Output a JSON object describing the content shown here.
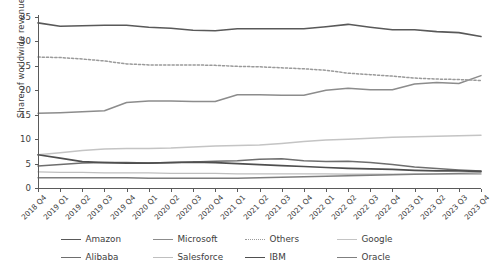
{
  "chart_data": {
    "type": "line",
    "title": "",
    "subtitle": "",
    "xlabel": "",
    "ylabel": "Share of worldwide revenues (%)",
    "ylim": [
      0,
      35
    ],
    "yticks": [
      0,
      5,
      10,
      15,
      20,
      25,
      30,
      35
    ],
    "ytick_labels": [
      "0",
      "5",
      "10",
      "15",
      "20",
      "25",
      "30",
      "35"
    ],
    "grid": false,
    "legend_position": "bottom",
    "categories": [
      "2018 Q4",
      "2019 Q1",
      "2019 Q2",
      "2019 Q3",
      "2019 Q4",
      "2020 Q1",
      "2020 Q2",
      "2020 Q3",
      "2020 Q4",
      "2021 Q1",
      "2021 Q2",
      "2021 Q3",
      "2021 Q4",
      "2022 Q1",
      "2022 Q2",
      "2022 Q3",
      "2022 Q4",
      "2023 Q1",
      "2023 Q2",
      "2023 Q3",
      "2023 Q4"
    ],
    "series": [
      {
        "name": "Amazon",
        "color": "#595959",
        "width": 1.6,
        "dash": "none",
        "values": [
          33.8,
          33.1,
          33.2,
          33.3,
          33.3,
          32.9,
          32.7,
          32.3,
          32.2,
          32.6,
          32.6,
          32.6,
          32.6,
          33.0,
          33.5,
          32.9,
          32.4,
          32.4,
          32.0,
          31.8,
          31.0
        ]
      },
      {
        "name": "Microsoft",
        "color": "#8c8c8c",
        "width": 1.5,
        "dash": "none",
        "values": [
          15.3,
          15.4,
          15.6,
          15.8,
          17.5,
          17.8,
          17.8,
          17.7,
          17.7,
          19.1,
          19.1,
          19.0,
          19.0,
          20.0,
          20.4,
          20.1,
          20.1,
          21.3,
          21.6,
          21.4,
          23.0
        ]
      },
      {
        "name": "Others",
        "color": "#9a9a9a",
        "width": 1.5,
        "dash": "dotted",
        "values": [
          26.8,
          26.7,
          26.4,
          26.0,
          25.4,
          25.2,
          25.2,
          25.2,
          25.1,
          24.9,
          24.8,
          24.6,
          24.4,
          24.1,
          23.5,
          23.2,
          22.9,
          22.5,
          22.3,
          22.2,
          22.0
        ]
      },
      {
        "name": "Google",
        "color": "#c4c4c4",
        "width": 1.5,
        "dash": "none",
        "values": [
          6.8,
          7.2,
          7.7,
          8.0,
          8.1,
          8.1,
          8.2,
          8.4,
          8.6,
          8.7,
          8.8,
          9.1,
          9.5,
          9.8,
          10.0,
          10.2,
          10.4,
          10.5,
          10.6,
          10.7,
          10.8
        ]
      },
      {
        "name": "Alibaba",
        "color": "#6e6e6e",
        "width": 1.5,
        "dash": "none",
        "values": [
          4.5,
          4.8,
          5.1,
          5.2,
          5.2,
          5.1,
          5.2,
          5.3,
          5.5,
          5.6,
          5.9,
          6.0,
          5.6,
          5.4,
          5.5,
          5.2,
          4.8,
          4.3,
          4.0,
          3.7,
          3.5
        ]
      },
      {
        "name": "Salesforce",
        "color": "#bfbfbf",
        "width": 1.4,
        "dash": "none",
        "values": [
          3.3,
          3.2,
          3.2,
          3.1,
          3.1,
          3.1,
          3.0,
          3.0,
          3.0,
          2.9,
          2.9,
          2.9,
          2.9,
          2.9,
          2.8,
          2.8,
          2.8,
          2.8,
          2.8,
          2.8,
          2.8
        ]
      },
      {
        "name": "IBM",
        "color": "#4f4f4f",
        "width": 1.7,
        "dash": "none",
        "values": [
          6.8,
          6.1,
          5.4,
          5.2,
          5.1,
          5.1,
          5.2,
          5.3,
          5.2,
          5.0,
          4.8,
          4.6,
          4.4,
          4.2,
          4.0,
          3.9,
          3.8,
          3.6,
          3.5,
          3.5,
          3.4
        ]
      },
      {
        "name": "Oracle",
        "color": "#7f7f7f",
        "width": 1.4,
        "dash": "none",
        "values": [
          2.1,
          2.1,
          2.1,
          2.1,
          2.1,
          2.0,
          2.0,
          2.0,
          2.0,
          2.0,
          2.1,
          2.2,
          2.3,
          2.4,
          2.5,
          2.6,
          2.7,
          2.8,
          2.9,
          3.0,
          3.1
        ]
      }
    ]
  },
  "legend": {
    "rows": [
      [
        {
          "label": "Amazon",
          "color": "#595959",
          "dash": "none",
          "width": 1.8
        },
        {
          "label": "Microsoft",
          "color": "#8c8c8c",
          "dash": "none",
          "width": 1.6
        },
        {
          "label": "Others",
          "color": "#9a9a9a",
          "dash": "dotted",
          "width": 1.6
        },
        {
          "label": "Google",
          "color": "#c4c4c4",
          "dash": "none",
          "width": 1.6
        }
      ],
      [
        {
          "label": "Alibaba",
          "color": "#6e6e6e",
          "dash": "none",
          "width": 1.6
        },
        {
          "label": "Salesforce",
          "color": "#bfbfbf",
          "dash": "none",
          "width": 1.6
        },
        {
          "label": "IBM",
          "color": "#4f4f4f",
          "dash": "none",
          "width": 1.9
        },
        {
          "label": "Oracle",
          "color": "#7f7f7f",
          "dash": "none",
          "width": 1.6
        }
      ]
    ]
  },
  "axis": {
    "line_color": "#5a5a5a",
    "tick_color": "#5a5a5a"
  }
}
